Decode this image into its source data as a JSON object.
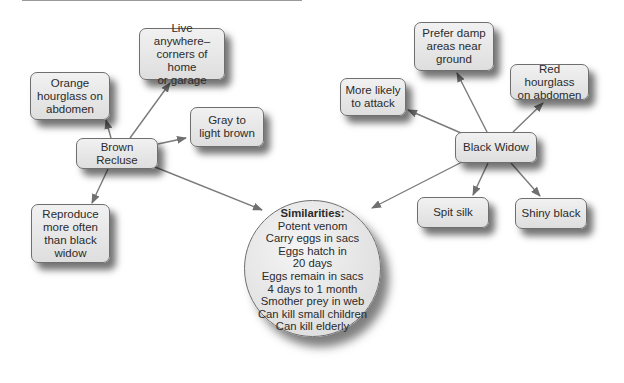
{
  "diagram": {
    "type": "concept-map",
    "center": {
      "title": "Similarities:",
      "items": [
        "Potent venom",
        "Carry eggs in sacs",
        "Eggs hatch in",
        "20 days",
        "Eggs remain in sacs",
        "4 days to 1 month",
        "Smother prey in web",
        "Can kill small children",
        "Can kill elderly"
      ]
    },
    "brown_recluse": {
      "label": "Brown Recluse",
      "traits": [
        "Orange\nhourglass on\nabdomen",
        "Live anywhere–\ncorners of home\nor garage",
        "Gray to\nlight brown",
        "Reproduce\nmore often\nthan black\nwidow"
      ]
    },
    "black_widow": {
      "label": "Black Widow",
      "traits": [
        "More likely\nto attack",
        "Prefer damp\nareas near\nground",
        "Red hourglass\non abdomen",
        "Spit silk",
        "Shiny black"
      ]
    }
  }
}
